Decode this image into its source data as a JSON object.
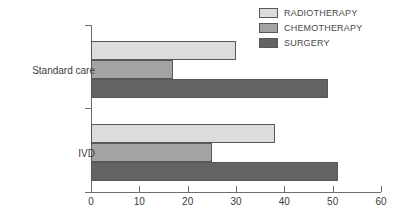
{
  "chart_data": {
    "type": "bar",
    "orientation": "horizontal",
    "title": "",
    "xlabel": "",
    "ylabel": "",
    "categories": [
      "Standard care",
      "IVD"
    ],
    "series": [
      {
        "name": "RADIOTHERAPY",
        "values": [
          30,
          38
        ],
        "color": "#dcdcdc"
      },
      {
        "name": "CHEMOTHERAPY",
        "values": [
          17,
          25
        ],
        "color": "#a3a3a3"
      },
      {
        "name": "SURGERY",
        "values": [
          49,
          51
        ],
        "color": "#636363"
      }
    ],
    "xlim": [
      0,
      60
    ],
    "xticks": [
      0,
      10,
      20,
      30,
      40,
      50,
      60
    ],
    "xticklabels": [
      "0",
      "10",
      "20",
      "30",
      "40",
      "50",
      "60"
    ],
    "grid": false,
    "legend_position": "top-right"
  },
  "legend": {
    "entries": [
      {
        "label": "RADIOTHERAPY"
      },
      {
        "label": "CHEMOTHERAPY"
      },
      {
        "label": "SURGERY"
      }
    ]
  },
  "axis": {
    "category_labels": [
      "Standard care",
      "IVD"
    ],
    "x_tick_labels": [
      "0",
      "10",
      "20",
      "30",
      "40",
      "50",
      "60"
    ]
  }
}
